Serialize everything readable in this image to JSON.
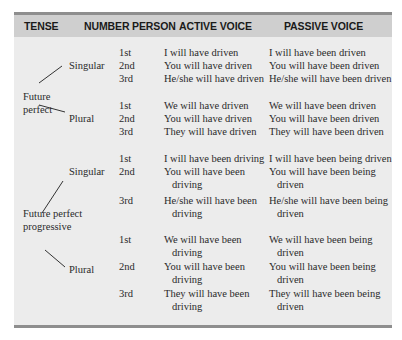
{
  "headers": {
    "tense": "TENSE",
    "number": "NUMBER",
    "person": "PERSON",
    "active": "ACTIVE VOICE",
    "passive": "PASSIVE VOICE"
  },
  "groups": [
    {
      "tense_line1": "Future",
      "tense_line2": "perfect",
      "singular_label": "Singular",
      "plural_label": "Plural",
      "rows": [
        {
          "person": "1st",
          "active": "I will have driven",
          "passive": "I will have been driven"
        },
        {
          "person": "2nd",
          "active": "You will have driven",
          "passive": "You will have been driven"
        },
        {
          "person": "3rd",
          "active": "He/she will have driven",
          "passive": "He/she will have been driven"
        },
        {
          "person": "1st",
          "active": "We will have driven",
          "passive": "We will have been driven"
        },
        {
          "person": "2nd",
          "active": "You will have driven",
          "passive": "You will have been driven"
        },
        {
          "person": "3rd",
          "active": "They will have driven",
          "passive": "They will have been driven"
        }
      ]
    },
    {
      "tense_line1": "Future perfect",
      "tense_line2": "progressive",
      "singular_label": "Singular",
      "plural_label": "Plural",
      "rows": [
        {
          "person": "1st",
          "active": "I will have been driving",
          "active2": "",
          "passive": "I will have been being driven",
          "passive2": ""
        },
        {
          "person": "2nd",
          "active": "You will have been",
          "active2": "driving",
          "passive": "You will have been being",
          "passive2": "driven"
        },
        {
          "person": "3rd",
          "active": "He/she will have been",
          "active2": "driving",
          "passive": "He/she will have been being",
          "passive2": "driven"
        },
        {
          "person": "1st",
          "active": "We will have been",
          "active2": "driving",
          "passive": "We will have been being",
          "passive2": "driven"
        },
        {
          "person": "2nd",
          "active": "You will have been",
          "active2": "driving",
          "passive": "You will have been being",
          "passive2": "driven"
        },
        {
          "person": "3rd",
          "active": "They will have been",
          "active2": "driving",
          "passive": "They will have been being",
          "passive2": "driven"
        }
      ]
    }
  ]
}
